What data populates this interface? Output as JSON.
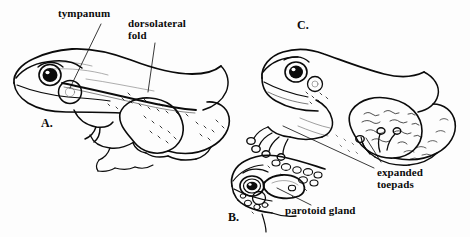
{
  "figure": {
    "background_color": "#fdfdfd",
    "ink_color": "#0b0b0b"
  },
  "panels": [
    {
      "id": "A",
      "letter": "A.",
      "subject": "true-frog-lateral-view",
      "x": 41,
      "y": 117
    },
    {
      "id": "B",
      "letter": "B.",
      "subject": "toad-head-lateral-view",
      "x": 228,
      "y": 211
    },
    {
      "id": "C",
      "letter": "C.",
      "subject": "tree-frog-lateral-view",
      "x": 297,
      "y": 19
    }
  ],
  "callouts": [
    {
      "id": "tympanum",
      "text": "tympanum",
      "lines": [
        "tympanum"
      ],
      "x": 58,
      "y": 8,
      "align": "left",
      "panel": "A"
    },
    {
      "id": "dorsolateral-fold",
      "text": "dorsolateral fold",
      "lines": [
        "dorsolateral",
        "fold"
      ],
      "x": 128,
      "y": 18,
      "align": "left",
      "panel": "A"
    },
    {
      "id": "expanded-toepads",
      "text": "expanded toepads",
      "lines": [
        "expanded",
        "toepads"
      ],
      "x": 377,
      "y": 167,
      "align": "left",
      "panel": "C"
    },
    {
      "id": "parotoid-gland",
      "text": "parotoid gland",
      "lines": [
        "parotoid gland"
      ],
      "x": 285,
      "y": 205,
      "align": "left",
      "panel": "B"
    }
  ],
  "leader_lines": [
    {
      "id": "tympanum-leader",
      "from": [
        101,
        24
      ],
      "to": [
        70,
        88
      ]
    },
    {
      "id": "dorsolateral-fold-leader",
      "from": [
        155,
        43
      ],
      "to": [
        148,
        92
      ]
    },
    {
      "id": "toepads-leader-front-foot",
      "from": [
        374,
        168
      ],
      "to": [
        283,
        126
      ]
    },
    {
      "id": "toepads-leader-hind-toe",
      "from": [
        381,
        162
      ],
      "to": [
        366,
        138
      ]
    },
    {
      "id": "parotoid-leader",
      "from": [
        311,
        205
      ],
      "to": [
        277,
        188
      ]
    }
  ]
}
